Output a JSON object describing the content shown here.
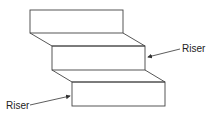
{
  "diagram": {
    "type": "staircase",
    "stroke_color": "#444444",
    "labels": {
      "riser_right": "Riser",
      "riser_left": "Riser"
    },
    "steps": [
      {
        "name": "top-step",
        "riser": [
          30,
          10,
          123,
          33
        ]
      },
      {
        "name": "middle-step",
        "riser": [
          52,
          46,
          145,
          70
        ]
      },
      {
        "name": "bottom-step",
        "riser": [
          72,
          82,
          165,
          106
        ]
      }
    ]
  }
}
